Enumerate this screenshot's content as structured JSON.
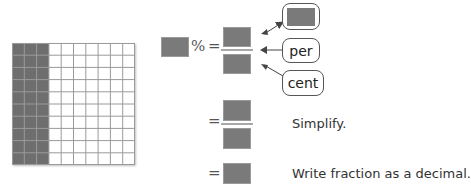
{
  "grid": {
    "rows": 10,
    "columns": 10,
    "shaded_columns": 3,
    "shaded_color": "#6e6e6e",
    "line_color": "#9a9a9a"
  },
  "equation": {
    "percent_symbol": "%",
    "equals_symbol": "=",
    "callouts": {
      "top": "",
      "middle": "per",
      "bottom": "cent"
    }
  },
  "steps": [
    {
      "note": "Simplify."
    },
    {
      "note": "Write fraction as a decimal."
    }
  ]
}
